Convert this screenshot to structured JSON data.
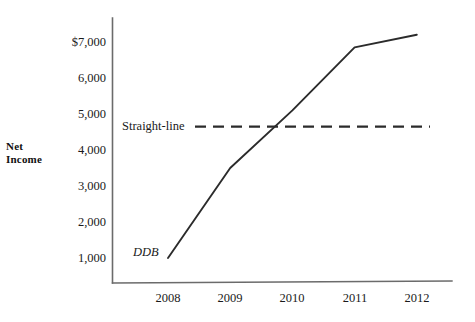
{
  "chart_data": {
    "type": "line",
    "title": "",
    "xlabel": "",
    "ylabel": "Net\nIncome",
    "categories": [
      "2008",
      "2009",
      "2010",
      "2011",
      "2012"
    ],
    "x": [
      2008,
      2009,
      2010,
      2011,
      2012
    ],
    "ylim": [
      0,
      7400
    ],
    "xlim": [
      2007.6,
      2012.4
    ],
    "grid": false,
    "legend_position": "inline-annotations",
    "ytick_labels": [
      "$7,000",
      "6,000",
      "5,000",
      "4,000",
      "3,000",
      "2,000",
      "1,000"
    ],
    "ytick_values": [
      7000,
      6000,
      5000,
      4000,
      3000,
      2000,
      1000
    ],
    "xtick_labels": [
      "2008",
      "2009",
      "2010",
      "2011",
      "2012"
    ],
    "series": [
      {
        "name": "DDB",
        "style": "solid",
        "color": "#2b2b2b",
        "values": [
          1000,
          3500,
          5100,
          6850,
          7200
        ]
      },
      {
        "name": "Straight-line",
        "style": "dashed",
        "color": "#2b2b2b",
        "values": [
          4650,
          4650,
          4650,
          4650,
          4650
        ]
      }
    ],
    "annotations": [
      {
        "text": "Straight-line",
        "series": "Straight-line",
        "style": "normal"
      },
      {
        "text": "DDB",
        "series": "DDB",
        "style": "italic"
      }
    ]
  },
  "axes": {
    "y_axis_title_line1": "Net",
    "y_axis_title_line2": "Income",
    "axis_color": "#555555"
  }
}
